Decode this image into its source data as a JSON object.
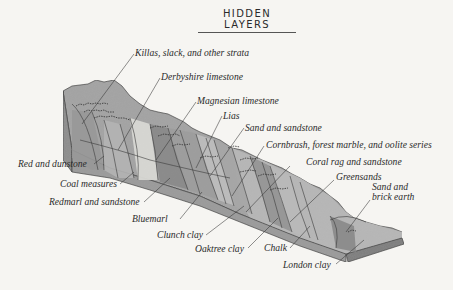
{
  "title": "HIDDEN LAYERS",
  "colors": {
    "background": "#f6f5f2",
    "rock_dark": "#8f8f8f",
    "rock_mid": "#a9a9a9",
    "rock_light": "#c4c4c4",
    "rock_pale": "#dcdcd8",
    "line": "#3a3a3a",
    "text": "#2b2b2b"
  },
  "labels": [
    {
      "id": "killas",
      "text": "Killas, slack, and other strata"
    },
    {
      "id": "derbyshire",
      "text": "Derbyshire limestone"
    },
    {
      "id": "magnesian",
      "text": "Magnesian limestone"
    },
    {
      "id": "lias",
      "text": "Lias"
    },
    {
      "id": "sand-sandstone",
      "text": "Sand and sandstone"
    },
    {
      "id": "cornbrash",
      "text": "Cornbrash, forest marble, and oolite series"
    },
    {
      "id": "coral-rag",
      "text": "Coral rag and sandstone"
    },
    {
      "id": "greensands",
      "text": "Greensands"
    },
    {
      "id": "sand-brick",
      "text": "Sand and\nbrick earth"
    },
    {
      "id": "red-dunstone",
      "text": "Red and dunstone"
    },
    {
      "id": "coal",
      "text": "Coal measures"
    },
    {
      "id": "redmarl",
      "text": "Redmarl and sandstone"
    },
    {
      "id": "bluemarl",
      "text": "Bluemarl"
    },
    {
      "id": "clunch",
      "text": "Clunch clay"
    },
    {
      "id": "oaktree",
      "text": "Oaktree clay"
    },
    {
      "id": "chalk",
      "text": "Chalk"
    },
    {
      "id": "london",
      "text": "London clay"
    }
  ]
}
